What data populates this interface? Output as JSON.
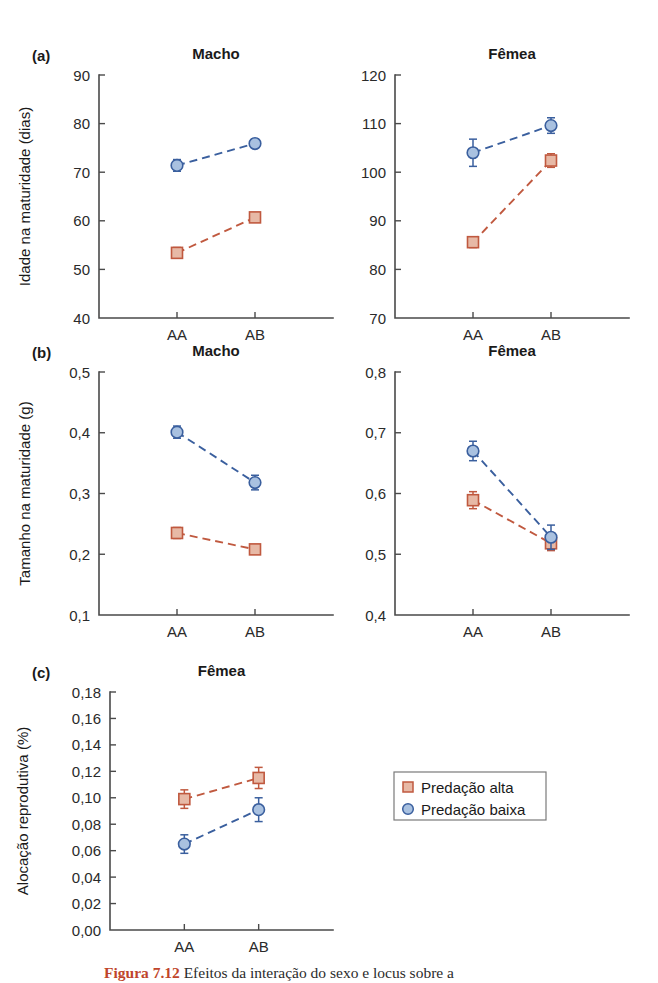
{
  "figure": {
    "background": "#ffffff",
    "caption_fragment": "Figura 7.12",
    "caption_rest": "Efeitos da interação do sexo e locus sobre a"
  },
  "legend": {
    "name": "series-legend",
    "x": 394,
    "y": 772,
    "width": 152,
    "height": 48,
    "entries": [
      {
        "label": "Predação alta",
        "marker": "square",
        "color": "#c0593f",
        "fill": "#e7b9a6"
      },
      {
        "label": "Predação baixa",
        "marker": "circle",
        "color": "#3a5f9e",
        "fill": "#a9c1e0"
      }
    ]
  },
  "colors": {
    "high_predation": "#c0593f",
    "high_predation_fill": "#e7b9a6",
    "low_predation": "#3a5f9e",
    "low_predation_fill": "#a9c1e0",
    "axis": "#4a4a4a",
    "text": "#1a1a1a"
  },
  "chart_data": [
    {
      "id": "panel-a-macho",
      "panel": "(a)",
      "type": "line",
      "title": "Macho",
      "xlabel": "",
      "ylabel": "Idade na maturidade (dias)",
      "categories": [
        "AA",
        "AB"
      ],
      "yticks": [
        40,
        50,
        60,
        70,
        80,
        90
      ],
      "ylim": [
        40,
        90
      ],
      "ytick_labels": [
        "40",
        "50",
        "60",
        "70",
        "80",
        "90"
      ],
      "grid": false,
      "legend_position": "none",
      "series": [
        {
          "name": "Predação alta",
          "marker": "square",
          "color": "#c0593f",
          "values": [
            53.4,
            60.7
          ],
          "errors": [
            1.1,
            0.8
          ]
        },
        {
          "name": "Predação baixa",
          "marker": "circle",
          "color": "#3a5f9e",
          "values": [
            71.4,
            75.9
          ],
          "errors": [
            1.2,
            0.9
          ]
        }
      ],
      "plot": {
        "x": 99,
        "y": 75,
        "w": 234,
        "h": 243
      }
    },
    {
      "id": "panel-a-femea",
      "panel": "",
      "type": "line",
      "title": "Fêmea",
      "xlabel": "",
      "ylabel": "",
      "categories": [
        "AA",
        "AB"
      ],
      "yticks": [
        70,
        80,
        90,
        100,
        110,
        120
      ],
      "ylim": [
        70,
        120
      ],
      "ytick_labels": [
        "70",
        "80",
        "90",
        "100",
        "110",
        "120"
      ],
      "grid": false,
      "legend_position": "none",
      "series": [
        {
          "name": "Predação alta",
          "marker": "square",
          "color": "#c0593f",
          "values": [
            85.6,
            102.4
          ],
          "errors": [
            1.1,
            1.4
          ]
        },
        {
          "name": "Predação baixa",
          "marker": "circle",
          "color": "#3a5f9e",
          "values": [
            104.0,
            109.6
          ],
          "errors": [
            2.8,
            1.6
          ]
        }
      ],
      "plot": {
        "x": 395,
        "y": 75,
        "w": 234,
        "h": 243
      }
    },
    {
      "id": "panel-b-macho",
      "panel": "(b)",
      "type": "line",
      "title": "Macho",
      "xlabel": "",
      "ylabel": "Tamanho na maturidade (g)",
      "categories": [
        "AA",
        "AB"
      ],
      "yticks": [
        0.1,
        0.2,
        0.3,
        0.4,
        0.5
      ],
      "ylim": [
        0.1,
        0.5
      ],
      "ytick_labels": [
        "0,1",
        "0,2",
        "0,3",
        "0,4",
        "0,5"
      ],
      "grid": false,
      "legend_position": "none",
      "series": [
        {
          "name": "Predação alta",
          "marker": "square",
          "color": "#c0593f",
          "values": [
            0.235,
            0.208
          ],
          "errors": [
            0.009,
            0.005
          ]
        },
        {
          "name": "Predação baixa",
          "marker": "circle",
          "color": "#3a5f9e",
          "values": [
            0.401,
            0.318
          ],
          "errors": [
            0.01,
            0.012
          ]
        }
      ],
      "plot": {
        "x": 99,
        "y": 372,
        "w": 234,
        "h": 243
      }
    },
    {
      "id": "panel-b-femea",
      "panel": "",
      "type": "line",
      "title": "Fêmea",
      "xlabel": "",
      "ylabel": "",
      "categories": [
        "AA",
        "AB"
      ],
      "yticks": [
        0.4,
        0.5,
        0.6,
        0.7,
        0.8
      ],
      "ylim": [
        0.4,
        0.8
      ],
      "ytick_labels": [
        "0,4",
        "0,5",
        "0,6",
        "0,7",
        "0,8"
      ],
      "grid": false,
      "legend_position": "none",
      "series": [
        {
          "name": "Predação alta",
          "marker": "square",
          "color": "#c0593f",
          "values": [
            0.589,
            0.518
          ],
          "errors": [
            0.014,
            0.012
          ]
        },
        {
          "name": "Predação baixa",
          "marker": "circle",
          "color": "#3a5f9e",
          "values": [
            0.67,
            0.528
          ],
          "errors": [
            0.016,
            0.02
          ]
        }
      ],
      "plot": {
        "x": 395,
        "y": 372,
        "w": 234,
        "h": 243
      }
    },
    {
      "id": "panel-c-femea",
      "panel": "(c)",
      "type": "line",
      "title": "Fêmea",
      "xlabel": "",
      "ylabel": "Alocação reprodutiva (%)",
      "categories": [
        "AA",
        "AB"
      ],
      "yticks": [
        0.0,
        0.02,
        0.04,
        0.06,
        0.08,
        0.1,
        0.12,
        0.14,
        0.16,
        0.18
      ],
      "ylim": [
        0.0,
        0.18
      ],
      "ytick_labels": [
        "0,00",
        "0,02",
        "0,04",
        "0,06",
        "0,08",
        "0,10",
        "0,12",
        "0,14",
        "0,16",
        "0,18"
      ],
      "grid": false,
      "legend_position": "right",
      "series": [
        {
          "name": "Predação alta",
          "marker": "square",
          "color": "#c0593f",
          "values": [
            0.099,
            0.115
          ],
          "errors": [
            0.007,
            0.008
          ]
        },
        {
          "name": "Predação baixa",
          "marker": "circle",
          "color": "#3a5f9e",
          "values": [
            0.065,
            0.091
          ],
          "errors": [
            0.007,
            0.009
          ]
        }
      ],
      "plot": {
        "x": 110,
        "y": 692,
        "w": 223,
        "h": 238
      }
    }
  ]
}
